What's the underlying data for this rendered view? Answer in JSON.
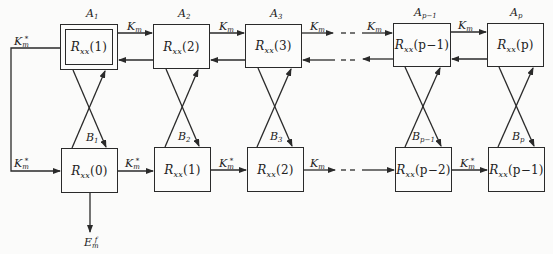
{
  "diagram": {
    "type": "lattice-flow-diagram",
    "top_row": [
      {
        "id": "A1",
        "label": "A",
        "label_sub": "1",
        "content_main": "R",
        "content_sub": "xx",
        "content_arg": "(1)",
        "double_border": true
      },
      {
        "id": "A2",
        "label": "A",
        "label_sub": "2",
        "content_main": "R",
        "content_sub": "xx",
        "content_arg": "(2)",
        "double_border": false
      },
      {
        "id": "A3",
        "label": "A",
        "label_sub": "3",
        "content_main": "R",
        "content_sub": "xx",
        "content_arg": "(3)",
        "double_border": false
      },
      {
        "id": "Ap-1",
        "label": "A",
        "label_sub": "p−1",
        "content_main": "R",
        "content_sub": "xx",
        "content_arg": "(p−1)",
        "double_border": false
      },
      {
        "id": "Ap",
        "label": "A",
        "label_sub": "p",
        "content_main": "R",
        "content_sub": "xx",
        "content_arg": "(p)",
        "double_border": false
      }
    ],
    "bottom_row": [
      {
        "id": "B1",
        "label": "B",
        "label_sub": "1",
        "content_main": "R",
        "content_sub": "xx",
        "content_arg": "(0)"
      },
      {
        "id": "B2",
        "label": "B",
        "label_sub": "2",
        "content_main": "R",
        "content_sub": "xx",
        "content_arg": "(1)"
      },
      {
        "id": "B3",
        "label": "B",
        "label_sub": "3",
        "content_main": "R",
        "content_sub": "xx",
        "content_arg": "(2)"
      },
      {
        "id": "Bp-1",
        "label": "B",
        "label_sub": "p−1",
        "content_main": "R",
        "content_sub": "xx",
        "content_arg": "(p−2)"
      },
      {
        "id": "Bp",
        "label": "B",
        "label_sub": "p",
        "content_main": "R",
        "content_sub": "xx",
        "content_arg": "(p−1)"
      }
    ],
    "top_arrows": [
      {
        "main": "K",
        "sub": "m",
        "sup": ""
      },
      {
        "main": "K",
        "sub": "m",
        "sup": ""
      },
      {
        "main": "K",
        "sub": "m",
        "sup": ""
      },
      {
        "main": "K",
        "sub": "m",
        "sup": ""
      },
      {
        "main": "K",
        "sub": "m",
        "sup": ""
      }
    ],
    "bottom_arrows": [
      {
        "main": "K",
        "sub": "m",
        "sup": "*"
      },
      {
        "main": "K",
        "sub": "m",
        "sup": "*"
      },
      {
        "main": "K",
        "sub": "m",
        "sup": ""
      },
      {
        "main": "K",
        "sub": "m",
        "sup": "*"
      }
    ],
    "feedback_top": {
      "main": "K",
      "sub": "m",
      "sup": "*"
    },
    "feedback_bottom": {
      "main": "K",
      "sub": "m",
      "sup": "*"
    },
    "output": {
      "main": "E",
      "sub": "m",
      "sup": "f"
    },
    "ellipsis": "- -",
    "line_color": "#2a2a2a",
    "background": "#fbfbfa"
  }
}
